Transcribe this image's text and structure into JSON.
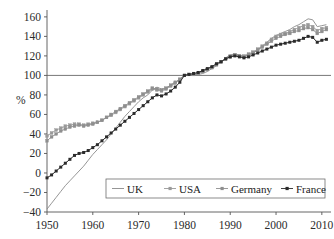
{
  "chart_data": {
    "type": "line",
    "title": "",
    "xlabel": "",
    "ylabel": "%",
    "xlim": [
      1950,
      2012
    ],
    "ylim": [
      -40,
      165
    ],
    "yticks": [
      -40,
      -20,
      0,
      20,
      40,
      60,
      80,
      100,
      120,
      140,
      160
    ],
    "ytick_labels": [
      "−40",
      "−20",
      "0",
      "20",
      "40",
      "60",
      "80",
      "100",
      "120",
      "140",
      "160"
    ],
    "xticks": [
      1950,
      1960,
      1970,
      1980,
      1990,
      2000,
      2010
    ],
    "xtick_labels": [
      "1950",
      "1960",
      "1970",
      "1980",
      "1990",
      "2000",
      "2010"
    ],
    "grid": false,
    "reference_line": {
      "y": 100,
      "label": ""
    },
    "legend_position": "bottom-center",
    "legend": [
      "UK",
      "USA",
      "Germany",
      "France"
    ],
    "colors": {
      "UK": "#8a8a8a",
      "USA": "#9a9a9a",
      "Germany": "#8f8f8f",
      "France": "#2b2b2b",
      "axis": "#555555",
      "background": "#ffffff"
    },
    "x": [
      1950,
      1951,
      1952,
      1953,
      1954,
      1955,
      1956,
      1957,
      1958,
      1959,
      1960,
      1961,
      1962,
      1963,
      1964,
      1965,
      1966,
      1967,
      1968,
      1969,
      1970,
      1971,
      1972,
      1973,
      1974,
      1975,
      1976,
      1977,
      1978,
      1979,
      1980,
      1981,
      1982,
      1983,
      1984,
      1985,
      1986,
      1987,
      1988,
      1989,
      1990,
      1991,
      1992,
      1993,
      1994,
      1995,
      1996,
      1997,
      1998,
      1999,
      2000,
      2001,
      2002,
      2003,
      2004,
      2005,
      2006,
      2007,
      2008,
      2009,
      2010,
      2011
    ],
    "series": [
      {
        "name": "UK",
        "marker": "none",
        "values": [
          -37,
          -31,
          -25,
          -19,
          -13,
          -8,
          -3,
          2,
          7,
          13,
          19,
          24,
          29,
          34,
          40,
          46,
          52,
          58,
          63,
          68,
          73,
          77,
          80,
          85,
          88,
          86,
          87,
          90,
          93,
          96,
          100,
          101,
          101,
          101,
          102,
          104,
          107,
          110,
          114,
          118,
          121,
          122,
          121,
          120,
          121,
          123,
          126,
          130,
          134,
          138,
          141,
          143,
          145,
          147,
          150,
          152,
          155,
          158,
          157,
          150,
          151,
          152
        ]
      },
      {
        "name": "USA",
        "marker": "square",
        "values": [
          38,
          41,
          44,
          46,
          48,
          49,
          50,
          50,
          49,
          50,
          51,
          52,
          54,
          57,
          59,
          62,
          65,
          68,
          71,
          74,
          77,
          80,
          83,
          86,
          85,
          84,
          86,
          89,
          92,
          96,
          100,
          101,
          101,
          102,
          104,
          106,
          108,
          111,
          114,
          117,
          120,
          121,
          120,
          120,
          122,
          124,
          127,
          130,
          133,
          137,
          140,
          142,
          143,
          145,
          147,
          149,
          151,
          152,
          150,
          146,
          148,
          149
        ]
      },
      {
        "name": "Germany",
        "marker": "square",
        "values": [
          33,
          37,
          40,
          43,
          45,
          47,
          48,
          49,
          48,
          49,
          50,
          52,
          54,
          57,
          60,
          63,
          66,
          69,
          72,
          75,
          78,
          81,
          84,
          87,
          86,
          85,
          87,
          90,
          93,
          96,
          100,
          101,
          101,
          102,
          104,
          106,
          108,
          111,
          114,
          117,
          119,
          121,
          120,
          119,
          121,
          123,
          126,
          129,
          132,
          135,
          138,
          140,
          142,
          143,
          145,
          146,
          148,
          149,
          147,
          143,
          145,
          147
        ]
      },
      {
        "name": "France",
        "marker": "diamond",
        "values": [
          -5,
          -2,
          2,
          6,
          10,
          14,
          18,
          20,
          21,
          23,
          26,
          29,
          33,
          37,
          41,
          45,
          49,
          53,
          57,
          61,
          65,
          69,
          73,
          77,
          80,
          79,
          81,
          84,
          88,
          93,
          100,
          101,
          102,
          103,
          105,
          107,
          109,
          112,
          114,
          117,
          119,
          120,
          119,
          118,
          119,
          121,
          123,
          125,
          127,
          129,
          131,
          132,
          133,
          134,
          135,
          136,
          138,
          140,
          139,
          134,
          136,
          137
        ]
      }
    ]
  }
}
